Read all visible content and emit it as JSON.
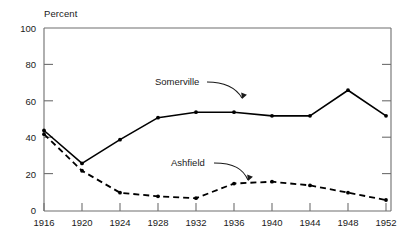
{
  "chart_data": {
    "type": "line",
    "title": "",
    "xlabel": "",
    "ylabel": "Percent",
    "ylim": [
      0,
      100
    ],
    "xlim": [
      1916,
      1952
    ],
    "grid": false,
    "legend_position": "inline-annotations",
    "x": [
      1916,
      1920,
      1924,
      1928,
      1932,
      1936,
      1940,
      1944,
      1948,
      1952
    ],
    "xtick_labels": [
      "1916",
      "1920",
      "1924",
      "1928",
      "1932",
      "1936",
      "1940",
      "1944",
      "1948",
      "1952"
    ],
    "ytick_labels": [
      "0",
      "20",
      "40",
      "60",
      "80",
      "100"
    ],
    "yticks": [
      0,
      20,
      40,
      60,
      80,
      100
    ],
    "series": [
      {
        "name": "Somerville",
        "style": "solid",
        "color": "#000000",
        "marker": "dot",
        "values": [
          44,
          26,
          39,
          51,
          54,
          54,
          52,
          52,
          66,
          52
        ]
      },
      {
        "name": "Ashfield",
        "style": "dashed",
        "color": "#000000",
        "marker": "dot",
        "values": [
          42,
          22,
          10,
          8,
          7,
          15,
          16,
          14,
          10,
          6
        ]
      }
    ],
    "annotations": [
      {
        "text": "Somerville",
        "target_series": "Somerville"
      },
      {
        "text": "Ashfield",
        "target_series": "Ashfield"
      }
    ],
    "colors": {
      "axis": "#6e6e6e",
      "line": "#000000",
      "text": "#1a1a1a",
      "background": "#ffffff"
    }
  },
  "axes": {
    "y_axis_title": "Percent"
  }
}
